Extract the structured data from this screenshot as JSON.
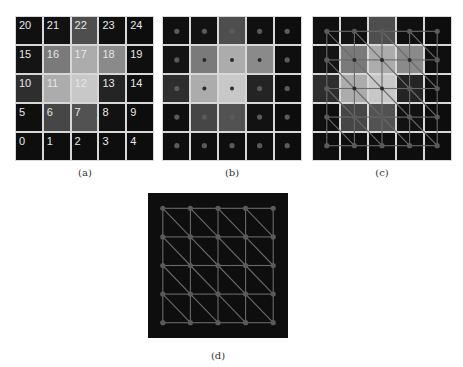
{
  "figure": {
    "panels": [
      {
        "id": "a",
        "caption": "(a)",
        "description": "5x5 pixel grid with indices"
      },
      {
        "id": "b",
        "caption": "(b)",
        "description": "pixel grid with node at each pixel center"
      },
      {
        "id": "c",
        "caption": "(c)",
        "description": "pixel grid with triangulated mesh over nodes"
      },
      {
        "id": "d",
        "caption": "(d)",
        "description": "triangulated mesh alone"
      }
    ],
    "grid": {
      "rows": 5,
      "cols": 5,
      "labels_top_to_bottom": [
        [
          "20",
          "21",
          "22",
          "23",
          "24"
        ],
        [
          "15",
          "16",
          "17",
          "18",
          "19"
        ],
        [
          "10",
          "11",
          "12",
          "13",
          "14"
        ],
        [
          "5",
          "6",
          "7",
          "8",
          "9"
        ],
        [
          "0",
          "1",
          "2",
          "3",
          "4"
        ]
      ],
      "gray_levels_top_to_bottom": [
        [
          16,
          18,
          78,
          16,
          13
        ],
        [
          20,
          122,
          172,
          138,
          15
        ],
        [
          46,
          172,
          200,
          36,
          15
        ],
        [
          15,
          70,
          82,
          18,
          13
        ],
        [
          14,
          14,
          14,
          14,
          13
        ]
      ]
    },
    "colors": {
      "grid_line": "#d8d8d8",
      "mesh_line": "#6a6a6a",
      "node_on_dark": "#5a5a5a",
      "node_on_light": "#2a2a2a",
      "mesh_background": "#0e0e0e"
    }
  }
}
